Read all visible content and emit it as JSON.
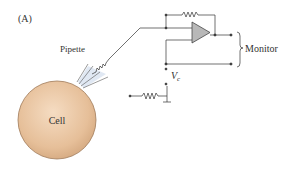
{
  "figure": {
    "panel_label": "(A)",
    "labels": {
      "pipette": "Pipette",
      "cell": "Cell",
      "monitor": "Monitor",
      "vc_main": "V",
      "vc_sub": "c"
    },
    "colors": {
      "cell_fill": "#e6bf99",
      "cell_stroke": "#a07a58",
      "pipette_fill": "#dde6f2",
      "amp_fill": "#b8b8b8",
      "wire": "#333333"
    }
  }
}
